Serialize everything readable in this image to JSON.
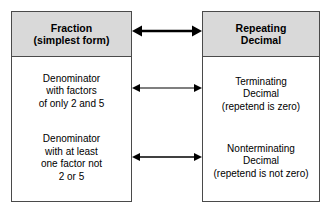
{
  "diagram": {
    "colors": {
      "header_fill": "#d9d9d9",
      "border": "#4a4a4a",
      "body_fill": "#ffffff",
      "text": "#000000",
      "arrow": "#000000"
    },
    "left_box": {
      "header": {
        "line1": "Fraction",
        "line2": "(simplest form)"
      },
      "rows": [
        {
          "line1": "Denominator",
          "line2": "with factors",
          "line3": "of only 2 and 5",
          "line4": ""
        },
        {
          "line1": "Denominator",
          "line2": "with at least",
          "line3": "one factor not",
          "line4": "2 or 5"
        }
      ]
    },
    "right_box": {
      "header": {
        "line1": "Repeating",
        "line2": "Decimal"
      },
      "rows": [
        {
          "line1": "Terminating",
          "line2": "Decimal",
          "line3": "(repetend is zero)",
          "line4": ""
        },
        {
          "line1": "Nonterminating",
          "line2": "Decimal",
          "line3": "(repetend is not zero)",
          "line4": ""
        }
      ]
    },
    "connectors": [
      {
        "name": "header-connector",
        "style": "double-headed",
        "weight": "thick"
      },
      {
        "name": "row1-connector",
        "style": "double-headed",
        "weight": "thin"
      },
      {
        "name": "row2-connector",
        "style": "double-headed",
        "weight": "thin"
      }
    ]
  }
}
